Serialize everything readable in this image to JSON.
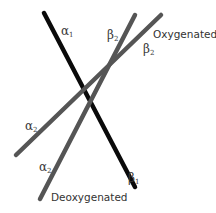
{
  "diagram": {
    "lines": [
      {
        "name": "alpha1-beta1-line",
        "x1": 44,
        "y1": 13,
        "x2": 135,
        "y2": 187,
        "color": "#0a0a0a",
        "width": 4.5
      },
      {
        "name": "deoxygenated-line",
        "x1": 40,
        "y1": 199,
        "x2": 135,
        "y2": 15,
        "color": "#555555",
        "width": 4.5
      },
      {
        "name": "oxygenated-line",
        "x1": 16,
        "y1": 155,
        "x2": 161,
        "y2": 15,
        "color": "#555555",
        "width": 4.5
      }
    ],
    "labels": {
      "alpha1": {
        "letter": "α",
        "sub": "1"
      },
      "beta2_deoxy": {
        "letter": "β",
        "sub": "2"
      },
      "beta2_oxy": {
        "letter": "β",
        "sub": "2"
      },
      "oxygenated": "Oxygenated",
      "alpha2_oxy": {
        "letter": "α",
        "sub": "2"
      },
      "alpha2_deoxy": {
        "letter": "α",
        "sub": "2"
      },
      "deoxygenated": "Deoxygenated",
      "beta1": {
        "letter": "β",
        "sub": "1"
      }
    }
  }
}
